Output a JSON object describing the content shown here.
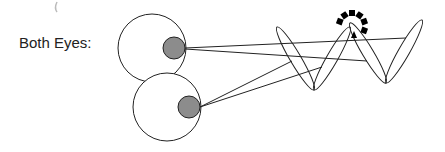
{
  "label": "Both Eyes:",
  "colors": {
    "stroke": "#222222",
    "pupil_fill": "#8c8c8c",
    "eye_fill": "#ffffff",
    "dash": "#000000",
    "artifact": "#bbbbbb"
  },
  "eyes": [
    {
      "name": "top-eye",
      "cx": 152,
      "cy": 48,
      "r": 34,
      "pupil": {
        "cx": 174,
        "cy": 48,
        "r": 11
      }
    },
    {
      "name": "bottom-eye",
      "cx": 167,
      "cy": 107,
      "r": 34,
      "pupil": {
        "cx": 189,
        "cy": 107,
        "r": 11
      }
    }
  ],
  "sight_lines": [
    {
      "from": [
        185,
        48
      ],
      "to": [
        406,
        38
      ]
    },
    {
      "from": [
        185,
        49
      ],
      "to": [
        367,
        61
      ]
    },
    {
      "from": [
        200,
        107
      ],
      "to": [
        292,
        61
      ]
    },
    {
      "from": [
        200,
        107
      ],
      "to": [
        322,
        67
      ]
    }
  ],
  "lenses": [
    {
      "x1": 277,
      "y1": 27,
      "x2": 314,
      "y2": 90
    },
    {
      "x1": 314,
      "y1": 90,
      "x2": 350,
      "y2": 27
    },
    {
      "x1": 350,
      "y1": 23,
      "x2": 386,
      "y2": 83
    },
    {
      "x1": 386,
      "y1": 83,
      "x2": 422,
      "y2": 20
    }
  ],
  "focus_marker": {
    "cx": 352,
    "cy": 26,
    "r": 13,
    "arrow": [
      354,
      37
    ]
  }
}
